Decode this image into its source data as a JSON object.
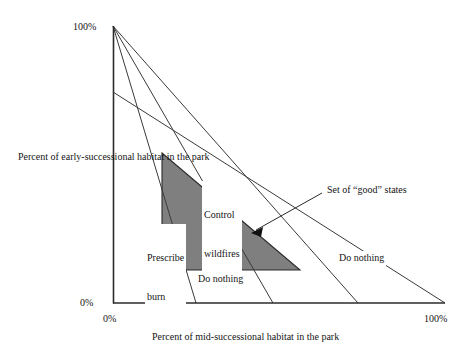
{
  "figure": {
    "type": "diagram",
    "axes": {
      "x": {
        "label": "Percent of mid-successional habitat in the park",
        "ticks": [
          "0%",
          "100%"
        ],
        "min": 0,
        "max": 100
      },
      "y": {
        "label": "Percent of early-successional habitat in the park",
        "ticks": [
          "0%",
          "100%"
        ],
        "min": 0,
        "max": 100
      }
    },
    "annotations": {
      "control_wildfires": "Control\nwildfires",
      "control_wildfires_line1": "Control",
      "control_wildfires_line2": "wildfires",
      "prescribe_burn_line1": "Prescribe",
      "prescribe_burn_line2": "burn",
      "do_nothing_inner": "Do nothing",
      "do_nothing_outer": "Do nothing",
      "good_states": "Set of “good” states"
    },
    "colors": {
      "line": "#3a3a3a",
      "axis": "#2b2b2b",
      "shaded_region_fill": "#7f7f7f",
      "background": "#ffffff",
      "text": "#151515"
    },
    "geometry": {
      "origin_px": [
        113,
        303
      ],
      "y_top_px": [
        113,
        26
      ],
      "x_right_px": [
        445,
        303
      ],
      "trajectory_lines": [
        {
          "name": "line-1",
          "from": [
            113,
            26
          ],
          "to": [
            196,
            303
          ]
        },
        {
          "name": "line-2",
          "from": [
            113,
            26
          ],
          "to": [
            273,
            303
          ]
        },
        {
          "name": "line-3",
          "from": [
            113,
            26
          ],
          "to": [
            358,
            303
          ]
        },
        {
          "name": "line-4",
          "from": [
            113,
            92
          ],
          "to": [
            445,
            303
          ]
        }
      ],
      "good_states_triangle": [
        [
          162,
          153
        ],
        [
          162,
          270
        ],
        [
          300,
          270
        ]
      ],
      "pointer_arrow": {
        "from": [
          322,
          193
        ],
        "to": [
          253,
          232
        ]
      }
    }
  }
}
